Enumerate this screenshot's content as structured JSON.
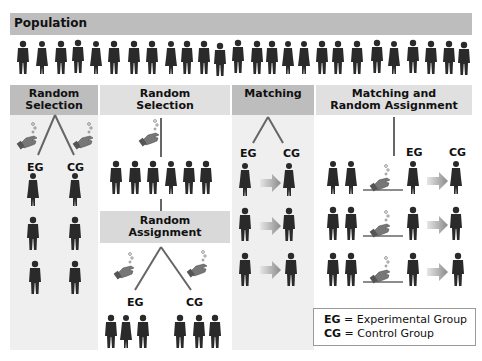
{
  "population": {
    "title": "Population",
    "count": 34
  },
  "columns": [
    {
      "id": "random-selection-1",
      "header": "Random\nSelection",
      "header_lines": [
        "Random",
        "Selection"
      ],
      "labels": {
        "eg": "EG",
        "cg": "CG"
      },
      "rows": 3
    },
    {
      "id": "random-selection-2",
      "header_lines": [
        "Random",
        "Selection"
      ],
      "sub_header_lines": [
        "Random",
        "Assignment"
      ],
      "selected_count": 6,
      "labels": {
        "eg": "EG",
        "cg": "CG"
      }
    },
    {
      "id": "matching",
      "header_lines": [
        "Matching"
      ],
      "labels": {
        "eg": "EG",
        "cg": "CG"
      },
      "rows": 3
    },
    {
      "id": "matching-random-assignment",
      "header_lines": [
        "Matching and",
        "Random Assignment"
      ],
      "labels": {
        "eg": "EG",
        "cg": "CG"
      },
      "rows": 3
    }
  ],
  "legend": {
    "eg_abbr": "EG",
    "eg_text": "= Experimental Group",
    "cg_abbr": "CG",
    "cg_text": "= Control Group"
  },
  "colors": {
    "header_dark": "#bdbdbd",
    "header_light": "#d9d9d9",
    "panel_bg": "#efefef",
    "silhouette": "#2a2a2a",
    "arrow": "#8a8a8a",
    "hand": "#6f6f6f"
  }
}
